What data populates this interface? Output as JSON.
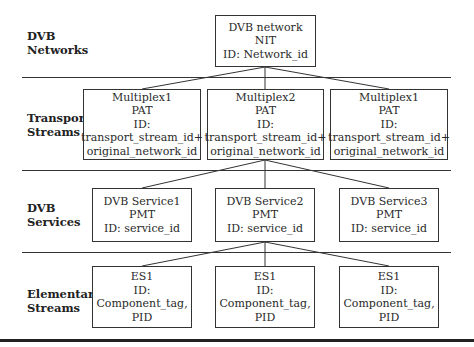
{
  "layers": [
    {
      "label_line1": "DVB",
      "label_line2": "Networks"
    },
    {
      "label_line1": "Transport",
      "label_line2": "Streams"
    },
    {
      "label_line1": "DVB",
      "label_line2": "Services"
    },
    {
      "label_line1": "Elementary",
      "label_line2": "Streams"
    }
  ],
  "network": {
    "lines": [
      "DVB network",
      "NIT",
      "ID: Network_id"
    ]
  },
  "multiplexes": [
    {
      "lines": [
        "Multiplex1",
        "PAT",
        "ID:",
        "transport_stream_id+",
        "original_network_id"
      ]
    },
    {
      "lines": [
        "Multiplex2",
        "PAT",
        "ID:",
        "transport_stream_id+",
        "original_network_id"
      ]
    },
    {
      "lines": [
        "Multiplex1",
        "PAT",
        "ID:",
        "transport_stream_id+",
        "original_network_id"
      ]
    }
  ],
  "services": [
    {
      "lines": [
        "DVB Service1",
        "PMT",
        "ID: service_id"
      ]
    },
    {
      "lines": [
        "DVB Service2",
        "PMT",
        "ID: service_id"
      ]
    },
    {
      "lines": [
        "DVB Service3",
        "PMT",
        "ID: service_id"
      ]
    }
  ],
  "elementary_streams": [
    {
      "lines": [
        "ES1",
        "ID:",
        "Component_tag,",
        "PID"
      ]
    },
    {
      "lines": [
        "ES1",
        "ID:",
        "Component_tag,",
        "PID"
      ]
    },
    {
      "lines": [
        "ES1",
        "ID:",
        "Component_tag,",
        "PID"
      ]
    }
  ],
  "edges": [
    {
      "from": "DVB network",
      "to": "Multiplex1"
    },
    {
      "from": "DVB network",
      "to": "Multiplex2"
    },
    {
      "from": "DVB network",
      "to": "Multiplex1 (third)"
    },
    {
      "from": "Multiplex2",
      "to": "DVB Service1"
    },
    {
      "from": "Multiplex2",
      "to": "DVB Service2"
    },
    {
      "from": "Multiplex2",
      "to": "DVB Service3"
    },
    {
      "from": "DVB Service2",
      "to": "ES1 (left)"
    },
    {
      "from": "DVB Service2",
      "to": "ES1 (center)"
    },
    {
      "from": "DVB Service2",
      "to": "ES1 (right)"
    }
  ]
}
